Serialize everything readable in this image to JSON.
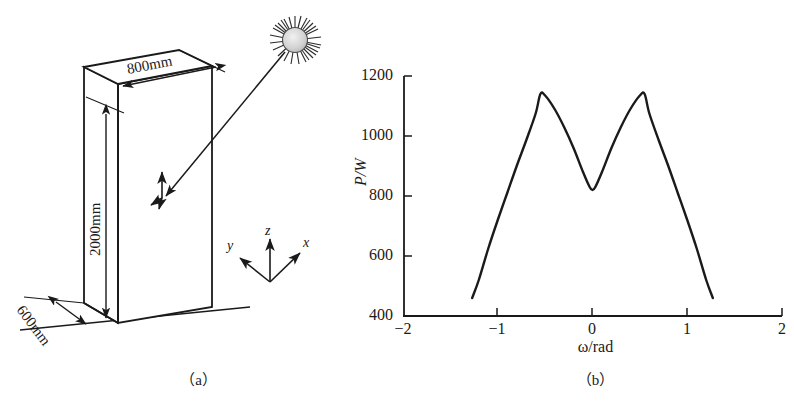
{
  "figure": {
    "panel_a": {
      "caption": "（a）",
      "dimensions": [
        {
          "name": "width-top",
          "label": "800mm"
        },
        {
          "name": "height-side",
          "label": "2000mm"
        },
        {
          "name": "depth-bottom",
          "label": "600mm"
        }
      ],
      "coordinate_axes": [
        {
          "name": "x",
          "label": "x"
        },
        {
          "name": "y",
          "label": "y"
        },
        {
          "name": "z",
          "label": "z"
        }
      ],
      "light_source": "sun-icon",
      "surface_normal": "normal-vector-icon"
    },
    "panel_b": {
      "caption": "（b）"
    }
  },
  "chart_data": {
    "type": "line",
    "title": "",
    "xlabel": "ω/rad",
    "ylabel": "P/W",
    "xlim": [
      -2,
      2
    ],
    "ylim": [
      400,
      1200
    ],
    "xticks": [
      -2,
      -1,
      0,
      1,
      2
    ],
    "xtick_labels": [
      "−2",
      "−1",
      "0",
      "1",
      "2"
    ],
    "yticks": [
      400,
      600,
      800,
      1000,
      1200
    ],
    "ytick_labels": [
      "400",
      "600",
      "800",
      "1000",
      "1200"
    ],
    "grid": false,
    "legend": null,
    "series": [
      {
        "name": "P(ω)",
        "x": [
          -1.27,
          -1.2,
          -1.1,
          -1.0,
          -0.9,
          -0.8,
          -0.7,
          -0.6,
          -0.55,
          -0.5,
          -0.4,
          -0.3,
          -0.2,
          -0.1,
          -0.03,
          0.0,
          0.03,
          0.1,
          0.2,
          0.3,
          0.4,
          0.5,
          0.55,
          0.6,
          0.7,
          0.8,
          0.9,
          1.0,
          1.1,
          1.2,
          1.27
        ],
        "y": [
          460,
          520,
          625,
          720,
          810,
          900,
          985,
          1075,
          1140,
          1135,
          1090,
          1030,
          960,
          880,
          830,
          820,
          830,
          880,
          960,
          1030,
          1090,
          1135,
          1140,
          1075,
          985,
          900,
          810,
          720,
          625,
          520,
          460
        ]
      }
    ],
    "annotations": {
      "left_peak": {
        "x": -0.55,
        "y": 1140
      },
      "valley": {
        "x": 0.0,
        "y": 820
      },
      "right_peak": {
        "x": 0.55,
        "y": 1140
      }
    }
  }
}
